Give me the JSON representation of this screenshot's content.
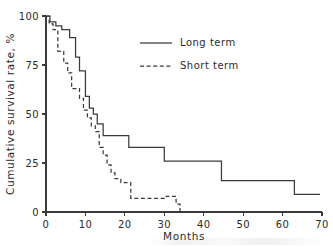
{
  "figure": {
    "background": "#ffffff",
    "line_color": "#3b3b3b",
    "axis_color": "#3a3a3a"
  },
  "chart_data": {
    "type": "line",
    "subtype": "kaplan-meier-step",
    "title": "",
    "xlabel": "Months",
    "ylabel": "Cumulative survival rate, %",
    "xlim": [
      0,
      70
    ],
    "ylim": [
      0,
      100
    ],
    "xticks": [
      0,
      10,
      20,
      30,
      40,
      50,
      60,
      70
    ],
    "xticklabels": [
      "0",
      "10",
      "20",
      "30",
      "40",
      "50",
      "60",
      "70"
    ],
    "yticks": [
      0,
      25,
      50,
      75,
      100
    ],
    "yticklabels": [
      "0",
      "25",
      "50",
      "75",
      "100"
    ],
    "grid": false,
    "legend_position": "upper center",
    "series": [
      {
        "name": "Long term",
        "style": "solid",
        "color": "#3b3b3b",
        "points": [
          [
            0,
            100
          ],
          [
            1,
            100
          ],
          [
            1,
            97
          ],
          [
            2.5,
            97
          ],
          [
            2.5,
            95
          ],
          [
            4,
            95
          ],
          [
            4,
            93
          ],
          [
            6,
            93
          ],
          [
            6,
            89
          ],
          [
            7.5,
            89
          ],
          [
            7.5,
            79
          ],
          [
            8.5,
            79
          ],
          [
            8.5,
            72
          ],
          [
            10,
            72
          ],
          [
            10,
            59
          ],
          [
            11,
            59
          ],
          [
            11,
            53
          ],
          [
            12,
            53
          ],
          [
            12,
            50
          ],
          [
            13,
            50
          ],
          [
            13,
            45
          ],
          [
            14.5,
            45
          ],
          [
            14.5,
            39
          ],
          [
            21,
            39
          ],
          [
            21,
            33
          ],
          [
            30,
            33
          ],
          [
            30,
            26
          ],
          [
            44.5,
            26
          ],
          [
            44.5,
            16
          ],
          [
            63,
            16
          ],
          [
            63,
            9
          ],
          [
            69.5,
            9
          ]
        ]
      },
      {
        "name": "Short term",
        "style": "dashed",
        "color": "#3b3b3b",
        "points": [
          [
            0,
            100
          ],
          [
            0.8,
            100
          ],
          [
            0.8,
            96
          ],
          [
            1.8,
            96
          ],
          [
            1.8,
            93
          ],
          [
            3,
            93
          ],
          [
            3,
            82
          ],
          [
            4.5,
            82
          ],
          [
            4.5,
            76
          ],
          [
            5.5,
            76
          ],
          [
            5.5,
            71
          ],
          [
            6.5,
            71
          ],
          [
            6.5,
            63
          ],
          [
            8.5,
            63
          ],
          [
            8.5,
            58
          ],
          [
            9.5,
            58
          ],
          [
            9.5,
            52
          ],
          [
            10.5,
            52
          ],
          [
            10.5,
            48
          ],
          [
            11.5,
            48
          ],
          [
            11.5,
            44
          ],
          [
            12.5,
            44
          ],
          [
            12.5,
            41
          ],
          [
            13.5,
            41
          ],
          [
            13.5,
            33
          ],
          [
            14.5,
            33
          ],
          [
            14.5,
            29
          ],
          [
            15.5,
            29
          ],
          [
            15.5,
            24
          ],
          [
            16.5,
            24
          ],
          [
            16.5,
            20
          ],
          [
            17.5,
            20
          ],
          [
            17.5,
            17
          ],
          [
            19,
            17
          ],
          [
            19,
            15
          ],
          [
            21.5,
            15
          ],
          [
            21.5,
            7
          ],
          [
            30.5,
            7
          ],
          [
            30.5,
            8
          ],
          [
            33,
            8
          ],
          [
            33,
            4
          ],
          [
            34,
            4
          ],
          [
            34,
            0
          ]
        ]
      }
    ],
    "legend": [
      {
        "label": "Long term",
        "style": "solid"
      },
      {
        "label": "Short term",
        "style": "dashed"
      }
    ]
  },
  "axes": {
    "y_title": "Cumulative survival rate, %",
    "x_title": "Months"
  }
}
